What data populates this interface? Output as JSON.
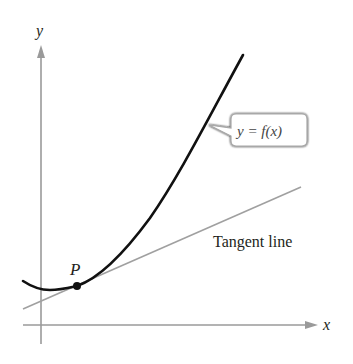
{
  "diagram": {
    "axes": {
      "x_label": "x",
      "y_label": "y",
      "color": "#9a9a9a"
    },
    "curve": {
      "label": "y = f(x)",
      "color": "#111111"
    },
    "tangent": {
      "label": "Tangent line",
      "color": "#a0a0a0"
    },
    "point": {
      "label": "P"
    }
  }
}
